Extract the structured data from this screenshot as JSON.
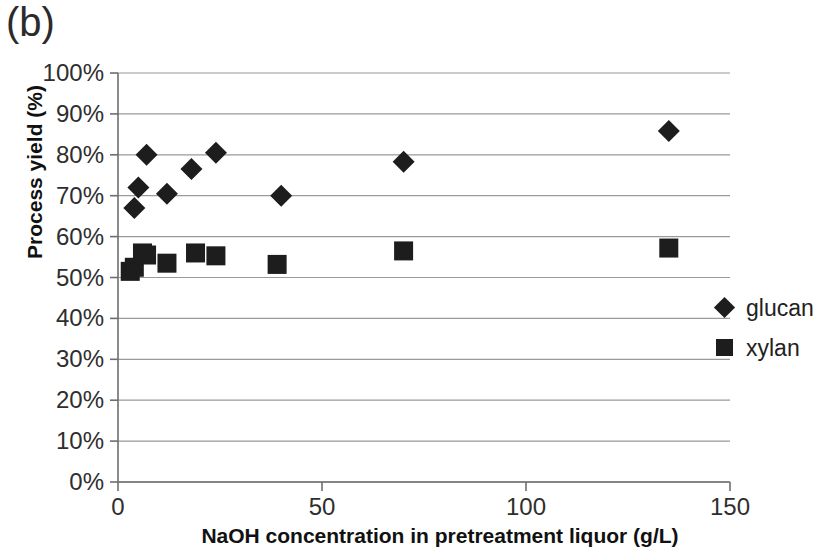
{
  "figure": {
    "panel_label": "(b)",
    "x_axis_title": "NaOH concentration in pretreatment liquor (g/L)",
    "y_axis_title": "Process yield (%)"
  },
  "legend": {
    "position": "right",
    "items": [
      {
        "label": "glucan",
        "marker": "diamond",
        "color": "#1d1d1d"
      },
      {
        "label": "xylan",
        "marker": "square",
        "color": "#1d1d1d"
      }
    ]
  },
  "axes": {
    "x_ticks": [
      "0",
      "50",
      "100",
      "150"
    ],
    "y_ticks": [
      "0%",
      "10%",
      "20%",
      "30%",
      "40%",
      "50%",
      "60%",
      "70%",
      "80%",
      "90%",
      "100%"
    ]
  },
  "chart_data": {
    "type": "scatter",
    "title": "(b)",
    "xlabel": "NaOH concentration in pretreatment liquor (g/L)",
    "ylabel": "Process yield (%)",
    "xlim": [
      0,
      150
    ],
    "ylim": [
      0,
      1.0
    ],
    "x_ticks": [
      0,
      50,
      100,
      150
    ],
    "y_ticks": [
      0,
      0.1,
      0.2,
      0.3,
      0.4,
      0.5,
      0.6,
      0.7,
      0.8,
      0.9,
      1.0
    ],
    "grid": "horizontal",
    "legend_position": "right",
    "series": [
      {
        "name": "glucan",
        "marker": "diamond",
        "color": "#1d1d1d",
        "points": [
          {
            "x": 4,
            "y": 0.67
          },
          {
            "x": 5,
            "y": 0.72
          },
          {
            "x": 7,
            "y": 0.8
          },
          {
            "x": 12,
            "y": 0.705
          },
          {
            "x": 18,
            "y": 0.765
          },
          {
            "x": 24,
            "y": 0.805
          },
          {
            "x": 40,
            "y": 0.7
          },
          {
            "x": 70,
            "y": 0.783
          },
          {
            "x": 135,
            "y": 0.858
          }
        ]
      },
      {
        "name": "xylan",
        "marker": "square",
        "color": "#1d1d1d",
        "points": [
          {
            "x": 3,
            "y": 0.515
          },
          {
            "x": 4,
            "y": 0.525
          },
          {
            "x": 6,
            "y": 0.56
          },
          {
            "x": 7,
            "y": 0.555
          },
          {
            "x": 12,
            "y": 0.535
          },
          {
            "x": 19,
            "y": 0.56
          },
          {
            "x": 24,
            "y": 0.553
          },
          {
            "x": 39,
            "y": 0.532
          },
          {
            "x": 70,
            "y": 0.565
          },
          {
            "x": 135,
            "y": 0.572
          }
        ]
      }
    ]
  }
}
